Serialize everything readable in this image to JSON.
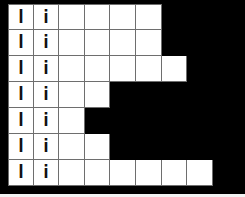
{
  "board": {
    "rows": 7,
    "columns": 8,
    "colors": {
      "background": "#000000",
      "cell": "#ffffff",
      "grid_line": "#6e6e6e",
      "letter": "#111111"
    },
    "row_lengths": [
      6,
      6,
      7,
      4,
      3,
      4,
      8
    ],
    "rows_data": [
      {
        "cells": [
          "l",
          "i",
          "",
          "",
          "",
          ""
        ]
      },
      {
        "cells": [
          "l",
          "i",
          "",
          "",
          "",
          ""
        ]
      },
      {
        "cells": [
          "l",
          "i",
          "",
          "",
          "",
          "",
          ""
        ]
      },
      {
        "cells": [
          "l",
          "i",
          "",
          ""
        ]
      },
      {
        "cells": [
          "l",
          "i",
          ""
        ]
      },
      {
        "cells": [
          "l",
          "i",
          "",
          ""
        ]
      },
      {
        "cells": [
          "l",
          "i",
          "",
          "",
          "",
          "",
          "",
          ""
        ]
      }
    ]
  }
}
